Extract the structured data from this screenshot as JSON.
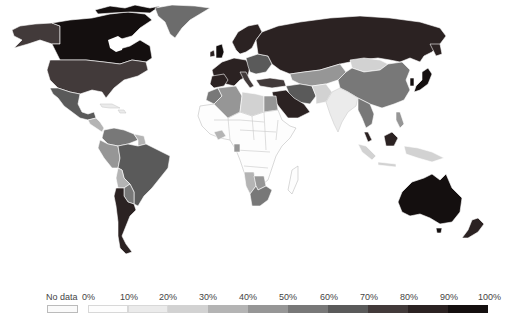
{
  "chart_data": {
    "type": "choropleth",
    "title": "",
    "legend": {
      "position": "bottom",
      "no_data_label": "No data",
      "tick_labels": [
        "0%",
        "10%",
        "20%",
        "30%",
        "40%",
        "50%",
        "60%",
        "70%",
        "80%",
        "90%",
        "100%"
      ],
      "bins": [
        {
          "range": "0-10%",
          "color": "#fdfdfd"
        },
        {
          "range": "10-20%",
          "color": "#ebebeb"
        },
        {
          "range": "20-30%",
          "color": "#d2d2d2"
        },
        {
          "range": "30-40%",
          "color": "#b4b4b4"
        },
        {
          "range": "40-50%",
          "color": "#969696"
        },
        {
          "range": "50-60%",
          "color": "#787878"
        },
        {
          "range": "60-70%",
          "color": "#5a5a5a"
        },
        {
          "range": "70-80%",
          "color": "#423a3a"
        },
        {
          "range": "80-90%",
          "color": "#2b2222"
        },
        {
          "range": "90-100%",
          "color": "#140f0f"
        }
      ]
    },
    "regions": [
      {
        "name": "Canada",
        "bin": "90-100%"
      },
      {
        "name": "Alaska (USA)",
        "bin": "70-80%"
      },
      {
        "name": "United States",
        "bin": "70-80%"
      },
      {
        "name": "Greenland",
        "bin": "50-60%"
      },
      {
        "name": "Mexico",
        "bin": "60-70%"
      },
      {
        "name": "Central America",
        "bin": "30-40%"
      },
      {
        "name": "Caribbean",
        "bin": "0-10%"
      },
      {
        "name": "Colombia/Venezuela",
        "bin": "50-60%"
      },
      {
        "name": "Peru/Ecuador",
        "bin": "40-50%"
      },
      {
        "name": "Bolivia",
        "bin": "30-40%"
      },
      {
        "name": "Brazil",
        "bin": "60-70%"
      },
      {
        "name": "Argentina/Chile",
        "bin": "80-90%"
      },
      {
        "name": "Western Europe",
        "bin": "80-90%"
      },
      {
        "name": "Scandinavia",
        "bin": "80-90%"
      },
      {
        "name": "Eastern Europe",
        "bin": "60-70%"
      },
      {
        "name": "Russia",
        "bin": "80-90%"
      },
      {
        "name": "Kazakhstan/Central Asia",
        "bin": "40-50%"
      },
      {
        "name": "Mongolia",
        "bin": "20-30%"
      },
      {
        "name": "China",
        "bin": "50-60%"
      },
      {
        "name": "Japan",
        "bin": "90-100%"
      },
      {
        "name": "South Korea",
        "bin": "90-100%"
      },
      {
        "name": "India",
        "bin": "10-20%"
      },
      {
        "name": "Iran",
        "bin": "60-70%"
      },
      {
        "name": "Turkey",
        "bin": "70-80%"
      },
      {
        "name": "Saudi Arabia",
        "bin": "80-90%"
      },
      {
        "name": "Egypt",
        "bin": "40-50%"
      },
      {
        "name": "Algeria",
        "bin": "40-50%"
      },
      {
        "name": "Libya",
        "bin": "20-30%"
      },
      {
        "name": "Sub-Saharan Africa",
        "bin": "0-10%"
      },
      {
        "name": "Southern Africa",
        "bin": "40-50%"
      },
      {
        "name": "South Africa",
        "bin": "50-60%"
      },
      {
        "name": "Southeast Asia",
        "bin": "50-60%"
      },
      {
        "name": "Malaysia",
        "bin": "80-90%"
      },
      {
        "name": "Indonesia",
        "bin": "20-30%"
      },
      {
        "name": "Australia",
        "bin": "90-100%"
      },
      {
        "name": "New Zealand",
        "bin": "80-90%"
      }
    ]
  }
}
